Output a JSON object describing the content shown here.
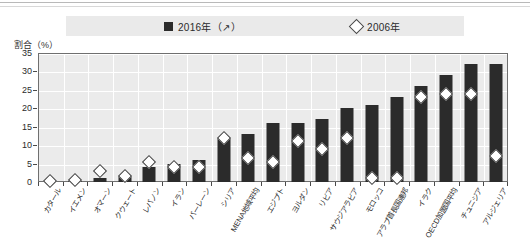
{
  "legend": {
    "series_2016_label": "2016年（↗）",
    "series_2006_label": "2006年",
    "marker_2016": "filled-square",
    "marker_2006": "open-diamond"
  },
  "axis": {
    "y_title": "割合（%）",
    "y_ticks": [
      "0",
      "5",
      "10",
      "15",
      "20",
      "25",
      "30",
      "35"
    ]
  },
  "colors": {
    "bar_2016": "#2b2b2b",
    "marker_2006_fill": "#ffffff",
    "marker_2006_stroke": "#3a3a3a",
    "plot_background": "#ebebeb",
    "gridline": "#ffffff",
    "frame": "#6f6f6f",
    "legend_background": "#eaeaea"
  },
  "chart_data": {
    "type": "bar",
    "title": "",
    "subtitle": "",
    "xlabel": "",
    "ylabel": "割合（%）",
    "ylim": [
      0,
      35
    ],
    "ytick_step": 5,
    "grid": true,
    "legend_position": "top",
    "categories": [
      "カタール",
      "イエメン",
      "オマーン",
      "クウェート",
      "レバノン",
      "イラン",
      "バーレーン",
      "シリア",
      "MENA地域平均",
      "エジプト",
      "ヨルダン",
      "リビア",
      "サウジアラビア",
      "モロッコ",
      "アラブ首長国連邦",
      "イラク",
      "OECD加盟国平均",
      "チュニジア",
      "アルジェリア"
    ],
    "series": [
      {
        "name": "2016年（↗）",
        "type": "bar",
        "values": [
          0.3,
          0.3,
          1.0,
          1.5,
          4.0,
          5.0,
          6.0,
          12.0,
          13.0,
          16.0,
          16.0,
          17.0,
          20.0,
          21.0,
          23.0,
          26.0,
          29.0,
          32.0,
          32.0
        ]
      },
      {
        "name": "2006年",
        "type": "scatter",
        "values": [
          0.3,
          0.5,
          3.0,
          1.5,
          5.5,
          4.0,
          4.0,
          12.0,
          6.5,
          5.5,
          11.0,
          9.0,
          12.0,
          1.0,
          1.0,
          23.0,
          24.0,
          24.0,
          7.0
        ]
      }
    ]
  }
}
